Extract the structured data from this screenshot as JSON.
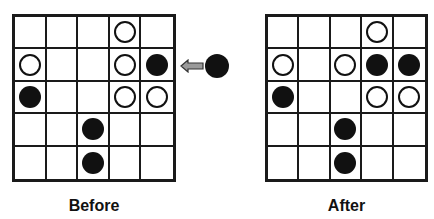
{
  "labels": {
    "before": "Before",
    "after": "After"
  },
  "colors": {
    "black_disc": "#111111",
    "white_disc_outline": "#111111",
    "grid_line": "#1a1a1a",
    "arrow_fill": "#9a9a9a"
  },
  "boards": {
    "before": [
      [
        "",
        "",
        "",
        "W",
        ""
      ],
      [
        "W",
        "",
        "",
        "W",
        "B"
      ],
      [
        "B",
        "",
        "",
        "W",
        "W"
      ],
      [
        "",
        "",
        "B",
        "",
        ""
      ],
      [
        "",
        "",
        "B",
        "",
        ""
      ]
    ],
    "after": [
      [
        "",
        "",
        "",
        "W",
        ""
      ],
      [
        "W",
        "",
        "W",
        "B",
        "B"
      ],
      [
        "B",
        "",
        "",
        "W",
        "W"
      ],
      [
        "",
        "",
        "B",
        "",
        ""
      ],
      [
        "",
        "",
        "B",
        "",
        ""
      ]
    ]
  },
  "incoming_piece": {
    "color": "B",
    "direction": "left",
    "row": 2
  }
}
